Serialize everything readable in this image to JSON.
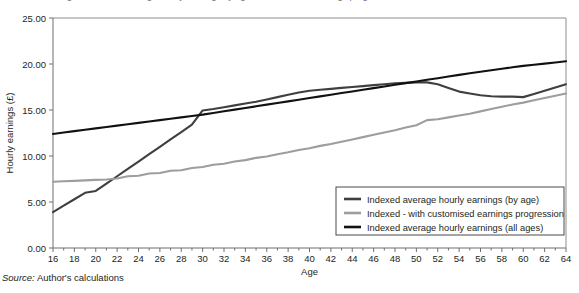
{
  "figure": {
    "top_clipped_caption": "Figure: Indexed average hourly earnings by age vs customised earnings progression",
    "source_label": "Source:",
    "source_text": "Author's calculations"
  },
  "colors": {
    "series_by_age": "#3f3f3f",
    "series_customised": "#9d9d9d",
    "series_all_ages": "#111111",
    "axis": "#6f6f6f",
    "plot_border": "#8d8d8d",
    "text": "#231f20",
    "background": "#ffffff"
  },
  "legend": {
    "position": "bottom-right-inside",
    "entries": [
      {
        "label": "Indexed average hourly earnings (by age)",
        "color": "#3f3f3f"
      },
      {
        "label": "Indexed - with customised earnings progression",
        "color": "#9d9d9d"
      },
      {
        "label": "Indexed average hourly earnings (all ages)",
        "color": "#111111"
      }
    ]
  },
  "chart_data": {
    "type": "line",
    "title": "",
    "xlabel": "Age",
    "ylabel": "Hourly earnings (£)",
    "xlim": [
      16,
      64
    ],
    "ylim": [
      0,
      25
    ],
    "ytick_values": [
      0,
      5,
      10,
      15,
      20,
      25
    ],
    "ytick_labels": [
      "0.00",
      "5.00",
      "10.00",
      "15.00",
      "20.00",
      "25.00"
    ],
    "xtick_values": [
      16,
      17,
      18,
      19,
      20,
      21,
      22,
      23,
      24,
      25,
      26,
      27,
      28,
      29,
      30,
      31,
      32,
      33,
      34,
      35,
      36,
      37,
      38,
      39,
      40,
      41,
      42,
      43,
      44,
      45,
      46,
      47,
      48,
      49,
      50,
      51,
      52,
      53,
      54,
      55,
      56,
      57,
      58,
      59,
      60,
      61,
      62,
      63,
      64
    ],
    "xtick_labels_every": 2,
    "xtick_labels": [
      "16",
      "18",
      "20",
      "22",
      "24",
      "26",
      "28",
      "30",
      "32",
      "34",
      "36",
      "38",
      "40",
      "42",
      "44",
      "46",
      "48",
      "50",
      "52",
      "54",
      "56",
      "58",
      "60",
      "62",
      "64"
    ],
    "grid": false,
    "x": [
      16,
      17,
      18,
      19,
      20,
      21,
      22,
      23,
      24,
      25,
      26,
      27,
      28,
      29,
      30,
      31,
      32,
      33,
      34,
      35,
      36,
      37,
      38,
      39,
      40,
      41,
      42,
      43,
      44,
      45,
      46,
      47,
      48,
      49,
      50,
      51,
      52,
      53,
      54,
      55,
      56,
      57,
      58,
      59,
      60,
      61,
      62,
      63,
      64
    ],
    "series": [
      {
        "name": "Indexed average hourly earnings (by age)",
        "color": "#3f3f3f",
        "values": [
          3.9,
          4.6,
          5.3,
          6.0,
          6.2,
          7.0,
          7.8,
          8.6,
          9.4,
          10.2,
          11.0,
          11.8,
          12.6,
          13.4,
          14.95,
          15.1,
          15.3,
          15.5,
          15.7,
          15.9,
          16.15,
          16.4,
          16.65,
          16.9,
          17.1,
          17.2,
          17.3,
          17.4,
          17.5,
          17.6,
          17.7,
          17.8,
          17.9,
          17.95,
          18.0,
          18.0,
          17.8,
          17.4,
          17.0,
          16.8,
          16.6,
          16.5,
          16.45,
          16.45,
          16.4,
          16.75,
          17.1,
          17.45,
          17.8
        ]
      },
      {
        "name": "Indexed - with customised earnings progression",
        "color": "#9d9d9d",
        "values": [
          7.2,
          7.25,
          7.3,
          7.35,
          7.4,
          7.45,
          7.55,
          7.8,
          7.85,
          8.1,
          8.15,
          8.4,
          8.45,
          8.7,
          8.8,
          9.05,
          9.15,
          9.4,
          9.55,
          9.8,
          9.95,
          10.2,
          10.4,
          10.65,
          10.85,
          11.1,
          11.3,
          11.55,
          11.8,
          12.05,
          12.3,
          12.55,
          12.8,
          13.1,
          13.35,
          13.9,
          14.0,
          14.2,
          14.4,
          14.6,
          14.85,
          15.1,
          15.35,
          15.6,
          15.8,
          16.05,
          16.3,
          16.55,
          16.8
        ]
      },
      {
        "name": "Indexed average hourly earnings (all ages)",
        "color": "#111111",
        "values": [
          12.4,
          12.55,
          12.7,
          12.85,
          13.0,
          13.15,
          13.3,
          13.45,
          13.6,
          13.75,
          13.9,
          14.05,
          14.2,
          14.35,
          14.5,
          14.68,
          14.86,
          15.04,
          15.22,
          15.4,
          15.58,
          15.76,
          15.94,
          16.12,
          16.3,
          16.48,
          16.66,
          16.84,
          17.02,
          17.2,
          17.38,
          17.56,
          17.74,
          17.92,
          18.1,
          18.28,
          18.46,
          18.64,
          18.82,
          19.0,
          19.16,
          19.32,
          19.48,
          19.64,
          19.8,
          19.92,
          20.04,
          20.16,
          20.3
        ]
      }
    ]
  }
}
